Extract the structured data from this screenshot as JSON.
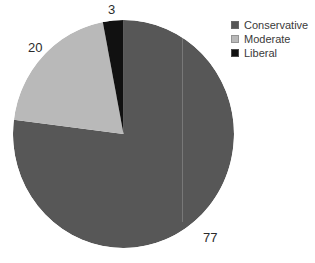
{
  "chart_data": {
    "type": "pie",
    "title": "",
    "categories": [
      "Conservative",
      "Moderate",
      "Liberal"
    ],
    "values": [
      77,
      20,
      3
    ],
    "labels": [
      "77",
      "20",
      "3"
    ],
    "colors": [
      "#575757",
      "#b9b9b9",
      "#111111"
    ],
    "start_angle_deg": 0,
    "direction": "clockwise",
    "legend_position": "right",
    "grid": false,
    "total": 100
  },
  "legend": {
    "items": [
      {
        "label": "Conservative",
        "color": "#575757",
        "swatch_name": "legend-swatch-conservative"
      },
      {
        "label": "Moderate",
        "color": "#b9b9b9",
        "swatch_name": "legend-swatch-moderate"
      },
      {
        "label": "Liberal",
        "color": "#111111",
        "swatch_name": "legend-swatch-liberal"
      }
    ]
  },
  "slice_labels": {
    "conservative": "77",
    "moderate": "20",
    "liberal": "3"
  },
  "colors": {
    "background": "#ffffff",
    "conservative": "#575757",
    "moderate": "#b9b9b9",
    "liberal": "#111111",
    "label_text": "#2b2b2b",
    "legend_text": "#3a3a3a"
  }
}
